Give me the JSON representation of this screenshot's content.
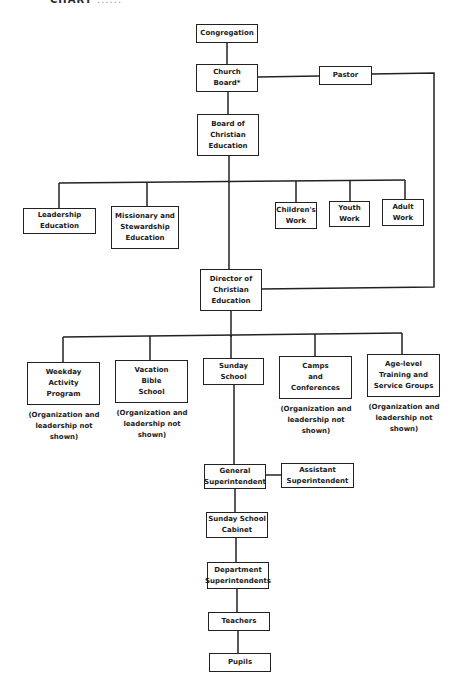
{
  "header": {
    "title": "CHART",
    "faint_text": "......"
  },
  "nodes": {
    "congregation": "Congregation",
    "church_board": "Church\nBoard*",
    "pastor": "Pastor",
    "board_ce": "Board of\nChristian\nEducation",
    "leadership_ed": "Leadership\nEducation",
    "missionary_ed": "Missionary and\nStewardship\nEducation",
    "childrens_work": "Children's\nWork",
    "youth_work": "Youth\nWork",
    "adult_work": "Adult\nWork",
    "director_ce": "Director of\nChristian\nEducation",
    "weekday": "Weekday\nActivity\nProgram",
    "vacation": "Vacation\nBible\nSchool",
    "sunday_school": "Sunday\nSchool",
    "camps": "Camps\nand\nConferences",
    "age_level": "Age-level\nTraining and\nService Groups",
    "general_supt": "General\nSuperintendent",
    "assistant_supt": "Assistant\nSuperintendent",
    "ss_cabinet": "Sunday School\nCabinet",
    "dept_supts": "Department\nSuperintendents",
    "teachers": "Teachers",
    "pupils": "Pupils"
  },
  "notes": {
    "weekday": "(Organization and\nleadership not\nshown)",
    "vacation": "(Organization and\nleadership not\nshown)",
    "camps": "(Organization and\nleadership not\nshown)",
    "age_level": "(Organization and\nleadership not\nshown)"
  }
}
